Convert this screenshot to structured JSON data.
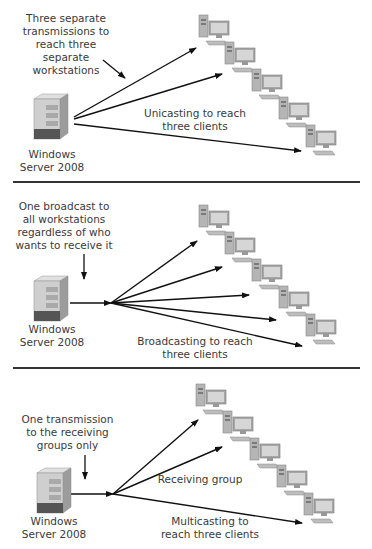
{
  "panels": [
    {
      "id": "unicast",
      "annotation": "Three separate\ntransmissions to\nreach three separate\nworkstations",
      "server_label": "Windows\nServer 2008",
      "caption": "Unicasting to reach\nthree clients",
      "workstation_count": 5
    },
    {
      "id": "broadcast",
      "annotation": "One broadcast to\nall workstations\nregardless of who\nwants to receive it",
      "server_label": "Windows\nServer 2008",
      "caption": "Broadcasting to reach\nthree clients",
      "workstation_count": 5
    },
    {
      "id": "multicast",
      "annotation": "One transmission\nto the receiving\ngroups only",
      "server_label": "Windows\nServer 2008",
      "caption": "Multicasting to\nreach three clients",
      "group_label": "Receiving group",
      "workstation_count": 5
    }
  ],
  "colors": {
    "line": "#111111",
    "divider": "#333333",
    "server_body": "#c8c8c8",
    "monitor": "#9a9a9a"
  }
}
